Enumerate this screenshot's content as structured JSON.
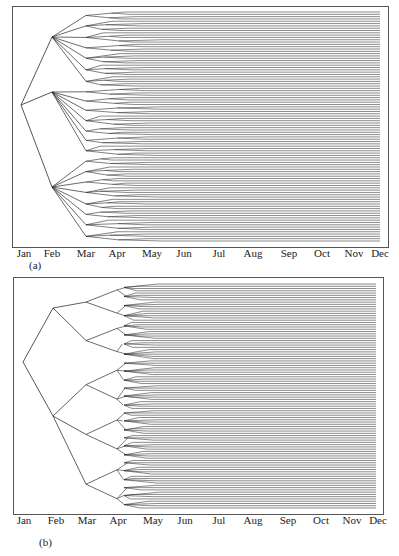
{
  "chart_data": [
    {
      "type": "tree",
      "panel_label": "(a)",
      "description": "Scenario tree branching over months; root in Jan, 3 branches at Feb, further branching Mar-May, then parallel scenario paths to Dec",
      "x_tick_labels": [
        "Jan",
        "Feb",
        "Mar",
        "Apr",
        "May",
        "Jun",
        "Jul",
        "Aug",
        "Sep",
        "Oct",
        "Nov",
        "Dec"
      ],
      "root_month": "Jan",
      "branching": [
        {
          "month": "Feb",
          "nodes": 3
        },
        {
          "month": "Mar",
          "nodes_per_parent": [
            8,
            7,
            9
          ]
        },
        {
          "month": "Apr",
          "branching": "fan-out into multiple children"
        },
        {
          "month": "May",
          "branching": "final fan-out"
        }
      ],
      "approx_leaf_count": 100,
      "frame": {
        "x": 12,
        "y": 6,
        "w": 376,
        "h": 241
      }
    },
    {
      "type": "tree",
      "panel_label": "(b)",
      "description": "Scenario tree: root in Jan, 2 branches at Feb, 3 children each at Mar, 2 at Apr, fan-out at May, then parallel paths to Dec",
      "x_tick_labels": [
        "Jan",
        "Feb",
        "Mar",
        "Apr",
        "May",
        "Jun",
        "Jul",
        "Aug",
        "Sep",
        "Oct",
        "Nov",
        "Dec"
      ],
      "root_month": "Jan",
      "branching": [
        {
          "month": "Feb",
          "nodes": 2
        },
        {
          "month": "Mar",
          "nodes_per_parent": [
            2,
            3
          ]
        },
        {
          "month": "Apr",
          "nodes_per_parent": 2
        },
        {
          "month": "May",
          "branching": "fan-out into multiple children"
        }
      ],
      "approx_leaf_count": 100,
      "frame": {
        "x": 13,
        "y": 277,
        "w": 370,
        "h": 237
      }
    }
  ],
  "panels": {
    "a": {
      "caption": "(a)"
    },
    "b": {
      "caption": "(b)"
    }
  },
  "months": [
    "Jan",
    "Feb",
    "Mar",
    "Apr",
    "May",
    "Jun",
    "Jul",
    "Aug",
    "Sep",
    "Oct",
    "Nov",
    "Dec"
  ],
  "colors": {
    "line": "#2a2a2a",
    "frame": "#555555"
  }
}
